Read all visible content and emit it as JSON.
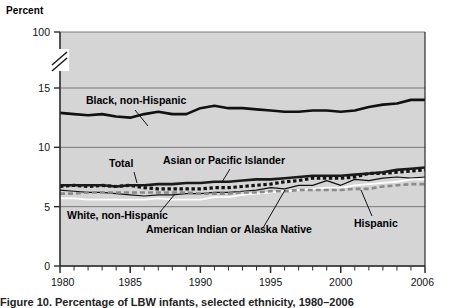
{
  "figure": {
    "y_axis_title": "Percent",
    "caption_partial": "Figure 10. Percentage of LBW infants, selected ethnicity, 1980–2006"
  },
  "chart_data": {
    "type": "line",
    "title": "",
    "xlabel": "",
    "ylabel": "Percent",
    "xlim": [
      1980,
      2006
    ],
    "ylim": [
      0,
      100
    ],
    "y_ticks": [
      "0",
      "5",
      "10",
      "15",
      "100"
    ],
    "y_tick_values": [
      0,
      5,
      10,
      15,
      100
    ],
    "axis_break": true,
    "axis_break_note": "Scale break between 15 and 100",
    "x_ticks": [
      "1980",
      "1985",
      "1990",
      "1995",
      "2000",
      "2006"
    ],
    "x_tick_values": [
      1980,
      1985,
      1990,
      1995,
      2000,
      2006
    ],
    "minor_x_ticks_every": 1,
    "grid": true,
    "legend_position": "inline-annotations",
    "plot_bg": "#d5d5d5",
    "x": [
      1980,
      1981,
      1982,
      1983,
      1984,
      1985,
      1986,
      1987,
      1988,
      1989,
      1990,
      1991,
      1992,
      1993,
      1994,
      1995,
      1996,
      1997,
      1998,
      1999,
      2000,
      2001,
      2002,
      2003,
      2004,
      2005,
      2006
    ],
    "series": [
      {
        "name": "Black, non-Hispanic",
        "style": "solid-thick-black",
        "color": "#111111",
        "values": [
          12.9,
          12.8,
          12.7,
          12.8,
          12.6,
          12.5,
          12.8,
          13.0,
          12.8,
          12.8,
          13.3,
          13.5,
          13.3,
          13.3,
          13.2,
          13.1,
          13.0,
          13.0,
          13.1,
          13.1,
          13.0,
          13.1,
          13.4,
          13.6,
          13.7,
          14.0,
          14.0
        ]
      },
      {
        "name": "Asian or Pacific Islander",
        "style": "dotted-black",
        "color": "#111111",
        "values": [
          6.7,
          6.8,
          6.7,
          6.8,
          6.7,
          6.8,
          6.6,
          6.5,
          6.5,
          6.5,
          6.5,
          6.6,
          6.6,
          6.7,
          6.8,
          6.9,
          7.1,
          7.2,
          7.4,
          7.4,
          7.4,
          7.5,
          7.8,
          7.8,
          7.9,
          8.0,
          8.1
        ]
      },
      {
        "name": "Total",
        "style": "solid-thick-black",
        "color": "#1a1a1a",
        "values": [
          6.8,
          6.8,
          6.8,
          6.8,
          6.7,
          6.8,
          6.8,
          6.9,
          6.9,
          7.0,
          7.0,
          7.1,
          7.1,
          7.2,
          7.3,
          7.3,
          7.4,
          7.5,
          7.6,
          7.6,
          7.6,
          7.7,
          7.8,
          7.9,
          8.1,
          8.2,
          8.3
        ]
      },
      {
        "name": "American Indian or Alaska Native",
        "style": "solid-thin-black",
        "color": "#111111",
        "values": [
          6.4,
          6.3,
          6.2,
          6.2,
          6.1,
          6.0,
          5.9,
          6.0,
          6.0,
          6.1,
          6.1,
          6.2,
          6.2,
          6.3,
          6.4,
          6.6,
          6.5,
          6.8,
          6.8,
          7.2,
          6.8,
          7.3,
          7.2,
          7.4,
          7.5,
          7.4,
          7.5
        ]
      },
      {
        "name": "White, non-Hispanic",
        "style": "solid-white",
        "color": "#ffffff",
        "values": [
          5.7,
          5.7,
          5.6,
          5.6,
          5.6,
          5.6,
          5.6,
          5.7,
          5.6,
          5.6,
          5.6,
          5.8,
          5.8,
          6.0,
          6.1,
          6.2,
          6.3,
          6.4,
          6.5,
          6.6,
          6.6,
          6.8,
          6.9,
          7.0,
          7.1,
          7.3,
          7.3
        ]
      },
      {
        "name": "Hispanic",
        "style": "dashed-gray",
        "color": "#8a8a8a",
        "values": [
          6.1,
          6.1,
          6.2,
          6.2,
          6.2,
          6.2,
          6.2,
          6.2,
          6.2,
          6.2,
          6.1,
          6.1,
          6.1,
          6.2,
          6.2,
          6.3,
          6.3,
          6.4,
          6.4,
          6.4,
          6.4,
          6.5,
          6.5,
          6.7,
          6.8,
          6.9,
          6.9
        ]
      }
    ],
    "annotations": [
      {
        "text": "Black, non-Hispanic",
        "x": 86,
        "y": 104
      },
      {
        "text": "Asian or Pacific Islander",
        "x": 163,
        "y": 164
      },
      {
        "text": "Total",
        "x": 109,
        "y": 167
      },
      {
        "text": "White, non-Hispanic",
        "x": 67,
        "y": 219
      },
      {
        "text": "American Indian or Alaska Native",
        "x": 146,
        "y": 233
      },
      {
        "text": "Hispanic",
        "x": 354,
        "y": 227
      }
    ]
  }
}
